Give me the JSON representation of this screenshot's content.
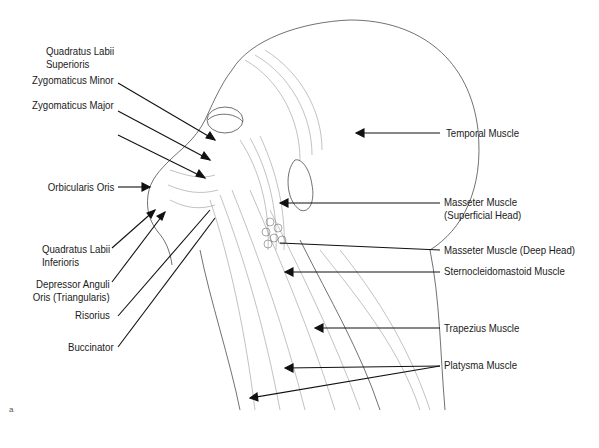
{
  "figure": {
    "panel_label": "a"
  },
  "labels_left": [
    {
      "id": "quadratus-labii-superioris",
      "line1": "Quadratus Labii",
      "line2": "Superioris"
    },
    {
      "id": "zygomaticus-minor",
      "line1": "Zygomaticus Minor",
      "line2": ""
    },
    {
      "id": "zygomaticus-major",
      "line1": "Zygomaticus Major",
      "line2": ""
    },
    {
      "id": "orbicularis-oris",
      "line1": "Orbicularis Oris",
      "line2": ""
    },
    {
      "id": "quadratus-labii-inferioris",
      "line1": "Quadratus Labii",
      "line2": "Inferioris"
    },
    {
      "id": "depressor-anguli-oris",
      "line1": "Depressor Anguli",
      "line2": "Oris (Triangularis)"
    },
    {
      "id": "risorius",
      "line1": "Risorius",
      "line2": ""
    },
    {
      "id": "buccinator",
      "line1": "Buccinator",
      "line2": ""
    }
  ],
  "labels_right": [
    {
      "id": "temporal-muscle",
      "line1": "Temporal Muscle",
      "line2": ""
    },
    {
      "id": "masseter-superficial",
      "line1": "Masseter Muscle",
      "line2": "(Superficial Head)"
    },
    {
      "id": "masseter-deep",
      "line1": "Masseter Muscle (Deep Head)",
      "line2": ""
    },
    {
      "id": "sternocleidomastoid",
      "line1": "Sternocleidomastoid Muscle",
      "line2": ""
    },
    {
      "id": "trapezius",
      "line1": "Trapezius Muscle",
      "line2": ""
    },
    {
      "id": "platysma",
      "line1": "Platysma Muscle",
      "line2": ""
    }
  ]
}
